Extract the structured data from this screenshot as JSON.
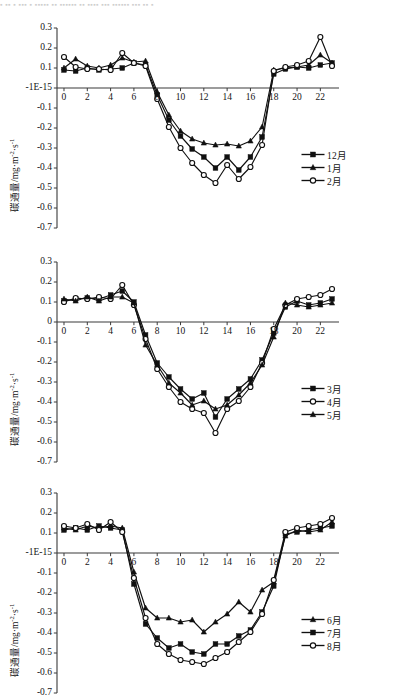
{
  "page": {
    "top_smudge_text": "▪ ▪▪ ▪ ▪▪▪ ▪ ▪▪▪▪▪ ▪▪ ▪▪▪▪▪▪ ▪▪ ▪▪▪▪ ▪▪▪ ▪▪▪▪▪▪ ▪▪▪ ▪▪ ▪"
  },
  "axis_title": {
    "prefix": "碳通量/mg·m",
    "sup1": "-2",
    "mid": "·s",
    "sup2": "-1"
  },
  "colors": {
    "ink": "#141414",
    "line": "#101010",
    "axis": "#3a3a3a",
    "marker_fill": "#101010",
    "marker_open_fill": "#ffffff",
    "background": "#ffffff"
  },
  "chart_data": [
    {
      "type": "line",
      "panel_id": "panel-winter",
      "title": "",
      "xlabel": "",
      "ylabel": "碳通量/mg·m-2·s-1",
      "xlim": [
        -0.6,
        23.6
      ],
      "ylim": [
        -0.7,
        0.3
      ],
      "grid": false,
      "legend_position": "right",
      "yticks": [
        0.3,
        0.2,
        0.1,
        0,
        -0.1,
        -0.2,
        -0.3,
        -0.4,
        -0.5,
        -0.6,
        -0.7
      ],
      "ytick_labels": [
        "0.3",
        "0.2",
        "0.1",
        "-1E-15",
        "-0.1",
        "-0.2",
        "-0.3",
        "-0.4",
        "-0.5",
        "-0.6",
        "-0.7"
      ],
      "xticks": [
        0,
        2,
        4,
        6,
        8,
        10,
        12,
        14,
        16,
        18,
        20,
        22
      ],
      "xtick_labels": [
        "0",
        "2",
        "4",
        "6",
        "8",
        "10",
        "12",
        "14",
        "16",
        "18",
        "20",
        "22"
      ],
      "x": [
        0,
        1,
        2,
        3,
        4,
        5,
        6,
        7,
        8,
        9,
        10,
        11,
        12,
        13,
        14,
        15,
        16,
        17,
        18,
        19,
        20,
        21,
        22,
        23
      ],
      "series": [
        {
          "name": "12月",
          "marker": "square-filled",
          "values": [
            0.09,
            0.085,
            0.1,
            0.09,
            0.095,
            0.1,
            0.125,
            0.115,
            -0.035,
            -0.16,
            -0.24,
            -0.305,
            -0.345,
            -0.4,
            -0.345,
            -0.41,
            -0.345,
            -0.245,
            0.07,
            0.095,
            0.105,
            0.1,
            0.115,
            0.125
          ]
        },
        {
          "name": "1月",
          "marker": "triangle-filled",
          "values": [
            0.1,
            0.145,
            0.11,
            0.1,
            0.115,
            0.15,
            0.13,
            0.135,
            -0.02,
            -0.135,
            -0.215,
            -0.255,
            -0.275,
            -0.285,
            -0.28,
            -0.29,
            -0.265,
            -0.195,
            0.09,
            0.1,
            0.105,
            0.115,
            0.165,
            0.125
          ]
        },
        {
          "name": "2月",
          "marker": "circle-open",
          "values": [
            0.155,
            0.105,
            0.095,
            0.095,
            0.09,
            0.175,
            0.125,
            0.11,
            -0.055,
            -0.195,
            -0.3,
            -0.375,
            -0.435,
            -0.475,
            -0.385,
            -0.455,
            -0.395,
            -0.285,
            0.085,
            0.105,
            0.115,
            0.135,
            0.255,
            0.11
          ]
        }
      ]
    },
    {
      "type": "line",
      "panel_id": "panel-spring",
      "title": "",
      "xlabel": "",
      "ylabel": "碳通量/mg·m-2·s-1",
      "xlim": [
        -0.6,
        23.6
      ],
      "ylim": [
        -0.7,
        0.3
      ],
      "grid": false,
      "legend_position": "right",
      "yticks": [
        0.3,
        0.2,
        0.1,
        0,
        -0.1,
        -0.2,
        -0.3,
        -0.4,
        -0.5,
        -0.6,
        -0.7
      ],
      "ytick_labels": [
        "0.3",
        "0.2",
        "0.1",
        "0",
        "-0.1",
        "-0.2",
        "-0.3",
        "-0.4",
        "-0.5",
        "-0.6",
        "-0.7"
      ],
      "xticks": [
        0,
        2,
        4,
        6,
        8,
        10,
        12,
        14,
        16,
        18,
        20,
        22
      ],
      "xtick_labels": [
        "0",
        "2",
        "4",
        "6",
        "8",
        "10",
        "12",
        "14",
        "16",
        "18",
        "20",
        "22"
      ],
      "x": [
        0,
        1,
        2,
        3,
        4,
        5,
        6,
        7,
        8,
        9,
        10,
        11,
        12,
        13,
        14,
        15,
        16,
        17,
        18,
        19,
        20,
        21,
        22,
        23
      ],
      "series": [
        {
          "name": "3月",
          "marker": "square-filled",
          "values": [
            0.105,
            0.115,
            0.12,
            0.115,
            0.135,
            0.155,
            0.1,
            -0.065,
            -0.205,
            -0.275,
            -0.335,
            -0.385,
            -0.355,
            -0.475,
            -0.385,
            -0.335,
            -0.285,
            -0.19,
            -0.055,
            0.075,
            0.105,
            0.085,
            0.095,
            0.115
          ]
        },
        {
          "name": "4月",
          "marker": "circle-open",
          "values": [
            0.1,
            0.12,
            0.115,
            0.125,
            0.115,
            0.185,
            0.085,
            -0.085,
            -0.235,
            -0.325,
            -0.4,
            -0.435,
            -0.455,
            -0.555,
            -0.435,
            -0.395,
            -0.325,
            -0.205,
            -0.035,
            0.085,
            0.115,
            0.125,
            0.135,
            0.165
          ]
        },
        {
          "name": "5月",
          "marker": "triangle-filled",
          "values": [
            0.115,
            0.105,
            0.125,
            0.105,
            0.125,
            0.125,
            0.095,
            -0.115,
            -0.215,
            -0.305,
            -0.355,
            -0.415,
            -0.395,
            -0.435,
            -0.415,
            -0.365,
            -0.305,
            -0.215,
            -0.075,
            0.095,
            0.085,
            0.075,
            0.085,
            0.095
          ]
        }
      ]
    },
    {
      "type": "line",
      "panel_id": "panel-summer",
      "title": "",
      "xlabel": "",
      "ylabel": "碳通量/mg·m-2·s-1",
      "xlim": [
        -0.6,
        23.6
      ],
      "ylim": [
        -0.7,
        0.3
      ],
      "grid": false,
      "legend_position": "right",
      "yticks": [
        0.3,
        0.2,
        0.1,
        0,
        -0.1,
        -0.2,
        -0.3,
        -0.4,
        -0.5,
        -0.6,
        -0.7
      ],
      "ytick_labels": [
        "0.3",
        "0.2",
        "0.1",
        "-1E-15",
        "-0.1",
        "-0.2",
        "-0.3",
        "-0.4",
        "-0.5",
        "-0.6",
        "-0.7"
      ],
      "xticks": [
        0,
        2,
        4,
        6,
        8,
        10,
        12,
        14,
        16,
        18,
        20,
        22
      ],
      "xtick_labels": [
        "0",
        "2",
        "4",
        "6",
        "8",
        "10",
        "12",
        "14",
        "16",
        "18",
        "20",
        "22"
      ],
      "x": [
        0,
        1,
        2,
        3,
        4,
        5,
        6,
        7,
        8,
        9,
        10,
        11,
        12,
        13,
        14,
        15,
        16,
        17,
        18,
        19,
        20,
        21,
        22,
        23
      ],
      "series": [
        {
          "name": "6月",
          "marker": "triangle-filled",
          "values": [
            0.125,
            0.115,
            0.135,
            0.125,
            0.135,
            0.125,
            -0.095,
            -0.275,
            -0.325,
            -0.325,
            -0.345,
            -0.335,
            -0.395,
            -0.345,
            -0.305,
            -0.245,
            -0.295,
            -0.185,
            -0.145,
            0.085,
            0.115,
            0.105,
            0.115,
            0.155
          ]
        },
        {
          "name": "7月",
          "marker": "square-filled",
          "values": [
            0.115,
            0.125,
            0.115,
            0.135,
            0.125,
            0.115,
            -0.155,
            -0.355,
            -0.425,
            -0.475,
            -0.455,
            -0.495,
            -0.505,
            -0.455,
            -0.455,
            -0.415,
            -0.385,
            -0.295,
            -0.165,
            0.095,
            0.105,
            0.115,
            0.125,
            0.135
          ]
        },
        {
          "name": "8月",
          "marker": "circle-open",
          "values": [
            0.135,
            0.125,
            0.145,
            0.115,
            0.155,
            0.105,
            -0.125,
            -0.325,
            -0.455,
            -0.505,
            -0.535,
            -0.545,
            -0.555,
            -0.525,
            -0.495,
            -0.445,
            -0.395,
            -0.305,
            -0.135,
            0.105,
            0.125,
            0.135,
            0.145,
            0.175
          ]
        }
      ]
    }
  ],
  "legends": [
    {
      "panel_id": "panel-winter",
      "items": [
        {
          "label": "12月",
          "marker": "square-filled"
        },
        {
          "label": "1月",
          "marker": "triangle-filled"
        },
        {
          "label": "2月",
          "marker": "circle-open"
        }
      ]
    },
    {
      "panel_id": "panel-spring",
      "items": [
        {
          "label": "3月",
          "marker": "square-filled"
        },
        {
          "label": "4月",
          "marker": "circle-open"
        },
        {
          "label": "5月",
          "marker": "triangle-filled"
        }
      ]
    },
    {
      "panel_id": "panel-summer",
      "items": [
        {
          "label": "6月",
          "marker": "triangle-filled"
        },
        {
          "label": "7月",
          "marker": "square-filled"
        },
        {
          "label": "8月",
          "marker": "circle-open"
        }
      ]
    }
  ]
}
